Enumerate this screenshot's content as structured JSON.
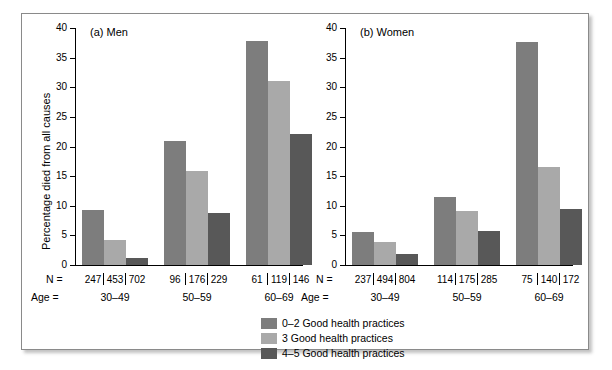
{
  "figure": {
    "y_axis_title": "Percentage died from all causes",
    "n_row_label": "N =",
    "age_row_label": "Age ="
  },
  "legend": {
    "items": [
      {
        "label": "0–2 Good health practices",
        "color": "#7d7d7d",
        "key": "0-2"
      },
      {
        "label": "3 Good health practices",
        "color": "#a9a9a9",
        "key": "3"
      },
      {
        "label": "4–5 Good health practices",
        "color": "#585858",
        "key": "4-5"
      }
    ]
  },
  "chart_data": [
    {
      "type": "bar",
      "title": "(a) Men",
      "panel": "a",
      "xlabel": "",
      "ylabel": "Percentage died from all causes",
      "ylim": [
        0,
        40
      ],
      "yticks": [
        0,
        5,
        10,
        15,
        20,
        25,
        30,
        35,
        40
      ],
      "grid": false,
      "legend_position": "bottom-center",
      "categories": [
        "30–49",
        "50–59",
        "60–69"
      ],
      "series": [
        {
          "name": "0–2 Good health practices",
          "color": "#7d7d7d",
          "values": [
            9.3,
            20.9,
            37.8
          ]
        },
        {
          "name": "3 Good health practices",
          "color": "#a9a9a9",
          "values": [
            4.3,
            15.8,
            31.0
          ]
        },
        {
          "name": "4–5 Good health practices",
          "color": "#585858",
          "values": [
            1.2,
            8.7,
            22.1
          ]
        }
      ],
      "n_counts": [
        [
          "247",
          "453",
          "702"
        ],
        [
          "96",
          "176",
          "229"
        ],
        [
          "61",
          "119",
          "146"
        ]
      ]
    },
    {
      "type": "bar",
      "title": "(b) Women",
      "panel": "b",
      "xlabel": "",
      "ylabel": "Percentage died from all causes",
      "ylim": [
        0,
        40
      ],
      "yticks": [
        0,
        5,
        10,
        15,
        20,
        25,
        30,
        35,
        40
      ],
      "grid": false,
      "legend_position": "bottom-center",
      "categories": [
        "30–49",
        "50–59",
        "60–69"
      ],
      "series": [
        {
          "name": "0–2 Good health practices",
          "color": "#7d7d7d",
          "values": [
            5.5,
            11.5,
            37.7
          ]
        },
        {
          "name": "3 Good health practices",
          "color": "#a9a9a9",
          "values": [
            3.9,
            9.1,
            16.5
          ]
        },
        {
          "name": "4–5 Good health practices",
          "color": "#585858",
          "values": [
            1.9,
            5.8,
            9.5
          ]
        }
      ],
      "n_counts": [
        [
          "237",
          "494",
          "804"
        ],
        [
          "114",
          "175",
          "285"
        ],
        [
          "75",
          "140",
          "172"
        ]
      ]
    }
  ]
}
